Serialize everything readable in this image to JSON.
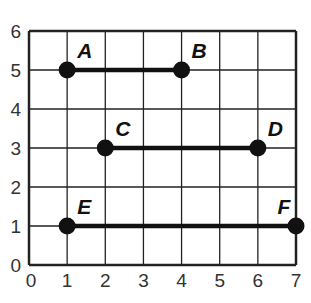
{
  "figure": {
    "type": "coordinate-grid",
    "x_ticks": [
      "0",
      "1",
      "2",
      "3",
      "4",
      "5",
      "6",
      "7"
    ],
    "y_ticks": [
      "0",
      "1",
      "2",
      "3",
      "4",
      "5",
      "6"
    ],
    "xlim": [
      0,
      7
    ],
    "ylim": [
      0,
      6
    ],
    "grid": true
  },
  "points": [
    {
      "label": "A",
      "x": 1,
      "y": 5
    },
    {
      "label": "B",
      "x": 4,
      "y": 5
    },
    {
      "label": "C",
      "x": 2,
      "y": 3
    },
    {
      "label": "D",
      "x": 6,
      "y": 3
    },
    {
      "label": "E",
      "x": 1,
      "y": 1
    },
    {
      "label": "F",
      "x": 7,
      "y": 1
    }
  ],
  "segments": [
    {
      "name": "AB",
      "from": "A",
      "to": "B"
    },
    {
      "name": "CD",
      "from": "C",
      "to": "D"
    },
    {
      "name": "EF",
      "from": "E",
      "to": "F"
    }
  ],
  "colors": {
    "line": "#111111",
    "grid": "#222222",
    "text": "#333333"
  }
}
